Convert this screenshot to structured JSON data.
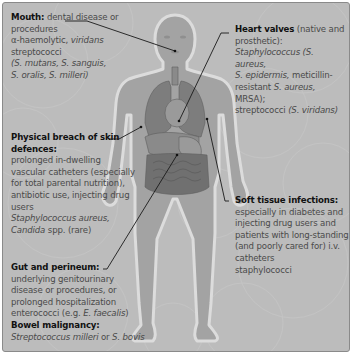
{
  "figure": {
    "colors": {
      "background": "#bdbdbd",
      "body_fill": "#a3a3a3",
      "body_outline": "#dcdcdc",
      "organ_fill": "#7d7d7d",
      "heading_text": "#111111",
      "body_text": "#4a4a4a",
      "leader_line": "#1a1a1a"
    }
  },
  "labels": {
    "mouth": {
      "heading": "Mouth:",
      "line1": " dental disease or",
      "line2": "procedures",
      "line3": "α-haemolytic, ",
      "line3_italic": "viridans",
      "line4": "streptococci",
      "line5": "(S. mutans, S. sanguis,",
      "line6": "S. oralis, S. milleri)"
    },
    "heart": {
      "heading": "Heart valves",
      "line1_rest": " (native and",
      "line2": "prosthetic):",
      "line3": "Staphylococcus (S. aureus,",
      "line4_italic": "S. epidermis,",
      "line4_rest": " meticillin-",
      "line5_rest": "resistant ",
      "line5_italic": "S. aureus,",
      "line5_end": " MRSA);",
      "line6": "streptococci ",
      "line6_italic": "(S. viridans)"
    },
    "skin": {
      "heading1": "Physical breach of skin",
      "heading2": "defences:",
      "line1": "prolonged in-dwelling",
      "line2": "vascular catheters (especially",
      "line3": "for total parental nutrition),",
      "line4": "antibiotic use, injecting drug",
      "line5": "users",
      "line6_italic": "Staphylococcus aureus,",
      "line7_italic": "Candida",
      "line7_rest": " spp. (rare)"
    },
    "soft_tissue": {
      "heading": "Soft tissue infections:",
      "line1": "especially in diabetes and",
      "line2": "injecting drug users and",
      "line3": "patients with long-standing",
      "line4": "(and poorly cared for) i.v.",
      "line5": "catheters",
      "line6": "staphylococci"
    },
    "gut": {
      "heading": "Gut and perineum:",
      "line1": "underlying genitourinary",
      "line2": "disease or procedures, or",
      "line3": "prolonged hospitalization",
      "line4": "enterococci (e.g. ",
      "line4_italic": "E. faecalis",
      "line4_end": ")",
      "heading2": "Bowel malignancy:",
      "line5_italic": "Streptococcus milleri",
      "line5_rest": " or ",
      "line5_italic2": "S. bovis"
    }
  }
}
